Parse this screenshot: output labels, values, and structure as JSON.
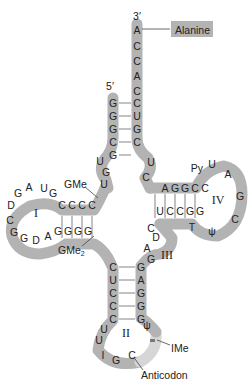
{
  "diagram": {
    "ends": {
      "three_prime": "3′",
      "five_prime": "5′"
    },
    "labels": {
      "amino_acid": "Alanine",
      "gme": "GMe",
      "gme2": "GMe2",
      "gme2_base": "GMe",
      "gme2_sub": "2",
      "ime": "IMe",
      "anticodon": "Anticodon"
    },
    "arms": {
      "I": "I",
      "II": "II",
      "III": "III",
      "IV": "IV"
    },
    "acceptor_stem": {
      "three_prime_strand": [
        "A",
        "C",
        "C",
        "A",
        "C",
        "C",
        "U",
        "G",
        "C"
      ],
      "five_prime_strand": [
        "G",
        "G",
        "G",
        "C",
        "G"
      ]
    },
    "junction_left": [
      "U",
      "G",
      "U"
    ],
    "junction_right": [
      "U",
      "C"
    ],
    "d_arm": {
      "top_strand": [
        "C",
        "C",
        "C",
        "C"
      ],
      "loop": [
        "G",
        "U",
        "A",
        "G",
        "D",
        "C",
        "G",
        "G",
        "D",
        "A"
      ],
      "bottom_strand": [
        "G",
        "G",
        "G",
        "G"
      ]
    },
    "anticodon_arm": {
      "left_strand": [
        "C",
        "U",
        "C",
        "C",
        "C"
      ],
      "right_strand": [
        "G",
        "A",
        "G",
        "G",
        "G"
      ],
      "loop": [
        "U",
        "U",
        "I",
        "G",
        "C",
        "IMe",
        "ψ"
      ]
    },
    "variable_loop": [
      "A",
      "G",
      "D",
      "C"
    ],
    "t_arm": {
      "top_strand": [
        "A",
        "G",
        "G",
        "C",
        "C"
      ],
      "loop": [
        "Py",
        "U",
        "A",
        "G",
        "C",
        "ψ",
        "T"
      ],
      "bottom_strand": [
        "U",
        "C",
        "C",
        "G",
        "G"
      ]
    },
    "colors": {
      "band": "#b3b3b3",
      "band_light": "#d6d6d6",
      "label_box": "#b3b3b3",
      "text": "#222222"
    }
  }
}
